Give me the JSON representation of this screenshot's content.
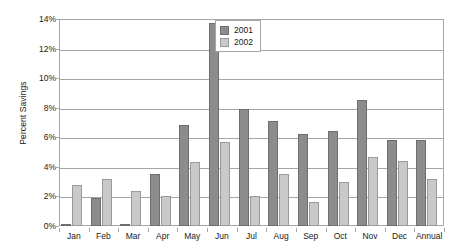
{
  "chart_data": {
    "type": "bar",
    "title": "",
    "xlabel": "",
    "ylabel": "Percent Savings",
    "ylim": [
      0,
      14
    ],
    "ytick_labels": [
      "14%",
      "12%",
      "10%",
      "8%",
      "6%",
      "4%",
      "2%",
      "0%"
    ],
    "ytick_values": [
      14,
      12,
      10,
      8,
      6,
      4,
      2,
      0
    ],
    "grid": true,
    "legend_position": "top-center",
    "categories": [
      "Jan",
      "Feb",
      "Mar",
      "Apr",
      "May",
      "Jun",
      "Jul",
      "Aug",
      "Sep",
      "Oct",
      "Nov",
      "Dec",
      "Annual"
    ],
    "series": [
      {
        "name": "2001",
        "color": "#8c8c8c",
        "values": [
          0.1,
          1.9,
          0.05,
          3.5,
          6.8,
          13.7,
          7.9,
          7.1,
          6.2,
          6.4,
          8.5,
          5.8,
          5.8
        ]
      },
      {
        "name": "2002",
        "color": "#c9c9c9",
        "values": [
          2.8,
          3.2,
          2.4,
          2.0,
          4.3,
          5.7,
          2.0,
          3.5,
          1.6,
          3.0,
          4.7,
          4.4,
          3.2
        ]
      }
    ]
  }
}
